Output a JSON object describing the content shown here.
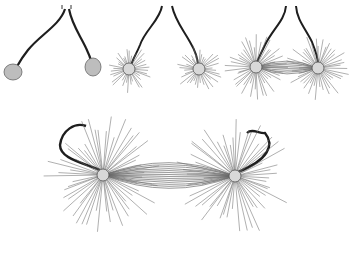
{
  "figure": {
    "colors": {
      "background": "#ffffff",
      "fiber": "#6e6e6e",
      "thread": "#1e1e1e",
      "body": "#9a9a9a"
    },
    "panels": [
      {
        "id": "stage-1",
        "label": "",
        "asters": [
          {
            "cx": 13,
            "cy": 72,
            "rays": 0,
            "r": 10
          },
          {
            "cx": 93,
            "cy": 67,
            "rays": 0,
            "r": 10
          }
        ],
        "apex": [
          67,
          8
        ],
        "spindle": false
      },
      {
        "id": "stage-2",
        "label": "",
        "asters": [
          {
            "cx": 129,
            "cy": 69,
            "rays": 36,
            "len": 22
          },
          {
            "cx": 199,
            "cy": 69,
            "rays": 36,
            "len": 22
          }
        ],
        "apex": [
          166,
          8
        ],
        "spindle": false
      },
      {
        "id": "stage-3",
        "label": "",
        "asters": [
          {
            "cx": 256,
            "cy": 67,
            "rays": 44,
            "len": 30
          },
          {
            "cx": 318,
            "cy": 68,
            "rays": 44,
            "len": 30
          }
        ],
        "apex": [
          287,
          6
        ],
        "spindle": true
      },
      {
        "id": "stage-4",
        "label": "",
        "asters": [
          {
            "cx": 103,
            "cy": 175,
            "rays": 56,
            "len": 55
          },
          {
            "cx": 235,
            "cy": 176,
            "rays": 56,
            "len": 55
          }
        ],
        "apex": null,
        "spindle": true
      }
    ]
  }
}
